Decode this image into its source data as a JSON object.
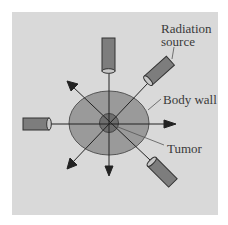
{
  "diagram": {
    "type": "radiation-therapy-beam-arrangement",
    "labels": {
      "radiation_source": [
        "Radiation",
        "source"
      ],
      "body_wall": "Body wall",
      "tumor": "Tumor"
    },
    "colors": {
      "background_panel": "#d9d9d9",
      "body_wall_fill": "#9a9a9a",
      "tumor_fill": "#6e6e6e",
      "tube_fill": "#7d7d7d",
      "line": "#222222"
    },
    "elements": {
      "sources_count": 5,
      "beam_arrows_count": 5
    }
  }
}
